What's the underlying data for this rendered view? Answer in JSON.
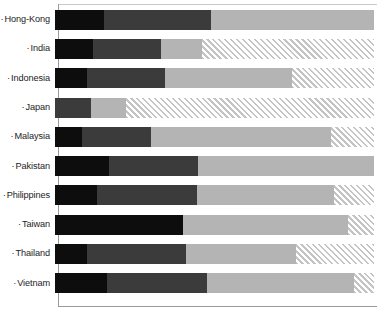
{
  "chart_data": {
    "type": "bar",
    "orientation": "horizontal",
    "stacked": true,
    "normalized": true,
    "title": "",
    "subtitle": "",
    "xlabel": "",
    "ylabel": "",
    "xlim": [
      0,
      100
    ],
    "grid": false,
    "legend_position": "none",
    "bullet": "·",
    "categories": [
      "Hong-Kong",
      "India",
      "Indonesia",
      "Japan",
      "Malaysia",
      "Pakistan",
      "Philippines",
      "Taiwan",
      "Thailand",
      "Vietnam"
    ],
    "series": [
      {
        "name": "Series 1",
        "color": "#0d0d0d",
        "pattern": "solid",
        "values": [
          15.4,
          11.9,
          10.0,
          0.0,
          8.5,
          16.9,
          13.2,
          40.1,
          10.0,
          16.3
        ]
      },
      {
        "name": "Series 2",
        "color": "#3b3b3b",
        "pattern": "solid",
        "values": [
          33.5,
          21.3,
          24.5,
          11.3,
          21.6,
          27.9,
          31.3,
          0.0,
          31.0,
          31.3
        ]
      },
      {
        "name": "Series 3",
        "color": "#b4b4b4",
        "pattern": "solid",
        "values": [
          51.1,
          12.9,
          39.8,
          11.0,
          56.4,
          55.2,
          42.9,
          51.7,
          34.5,
          46.1
        ]
      },
      {
        "name": "Series 4",
        "color": "#c4c4c4",
        "pattern": "diagonal-hatch",
        "values": [
          0.0,
          53.9,
          25.7,
          77.7,
          13.5,
          0.0,
          12.6,
          8.2,
          24.5,
          6.3
        ]
      }
    ],
    "rows": [
      {
        "label": "Hong-Kong",
        "s1": 15.4,
        "s2": 33.5,
        "s3": 51.1,
        "s4": 0.0
      },
      {
        "label": "India",
        "s1": 11.9,
        "s2": 21.3,
        "s3": 12.9,
        "s4": 53.9
      },
      {
        "label": "Indonesia",
        "s1": 10.0,
        "s2": 24.5,
        "s3": 39.8,
        "s4": 25.7
      },
      {
        "label": "Japan",
        "s1": 0.0,
        "s2": 11.3,
        "s3": 11.0,
        "s4": 77.7
      },
      {
        "label": "Malaysia",
        "s1": 8.5,
        "s2": 21.6,
        "s3": 56.4,
        "s4": 13.5
      },
      {
        "label": "Pakistan",
        "s1": 16.9,
        "s2": 27.9,
        "s3": 55.2,
        "s4": 0.0
      },
      {
        "label": "Philippines",
        "s1": 13.2,
        "s2": 31.3,
        "s3": 42.9,
        "s4": 12.6
      },
      {
        "label": "Taiwan",
        "s1": 40.1,
        "s2": 0.0,
        "s3": 51.7,
        "s4": 8.2
      },
      {
        "label": "Thailand",
        "s1": 10.0,
        "s2": 31.0,
        "s3": 34.5,
        "s4": 24.5
      },
      {
        "label": "Vietnam",
        "s1": 16.3,
        "s2": 31.3,
        "s3": 46.1,
        "s4": 6.3
      }
    ]
  },
  "axis": {
    "line_color": "#9a9a9a",
    "baseline_color": "#9a9a9a"
  }
}
